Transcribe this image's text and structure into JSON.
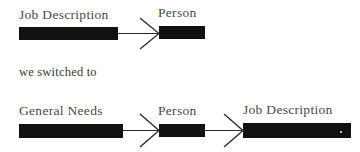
{
  "figure": {
    "type": "flow-diagram",
    "background_color": "#ffffff",
    "bar_color": "#111111",
    "text_color": "#4a4a4a",
    "arrow_color": "#2b2b2b",
    "caption": "we switched to",
    "rows": [
      {
        "id": "before",
        "nodes": [
          {
            "label": "Job Description",
            "bar_width": 99
          },
          {
            "label": "Person",
            "bar_width": 46
          }
        ],
        "arrows": 1
      },
      {
        "id": "after",
        "nodes": [
          {
            "label": "General Needs",
            "bar_width": 104
          },
          {
            "label": "Person",
            "bar_width": 46
          },
          {
            "label": "Job Description",
            "bar_width": 108
          }
        ],
        "arrows": 2
      }
    ]
  },
  "row1": {
    "node1_label": "Job Description",
    "node2_label": "Person"
  },
  "caption": {
    "text": "we switched to"
  },
  "row2": {
    "node1_label": "General Needs",
    "node2_label": "Person",
    "node3_label": "Job Description"
  }
}
